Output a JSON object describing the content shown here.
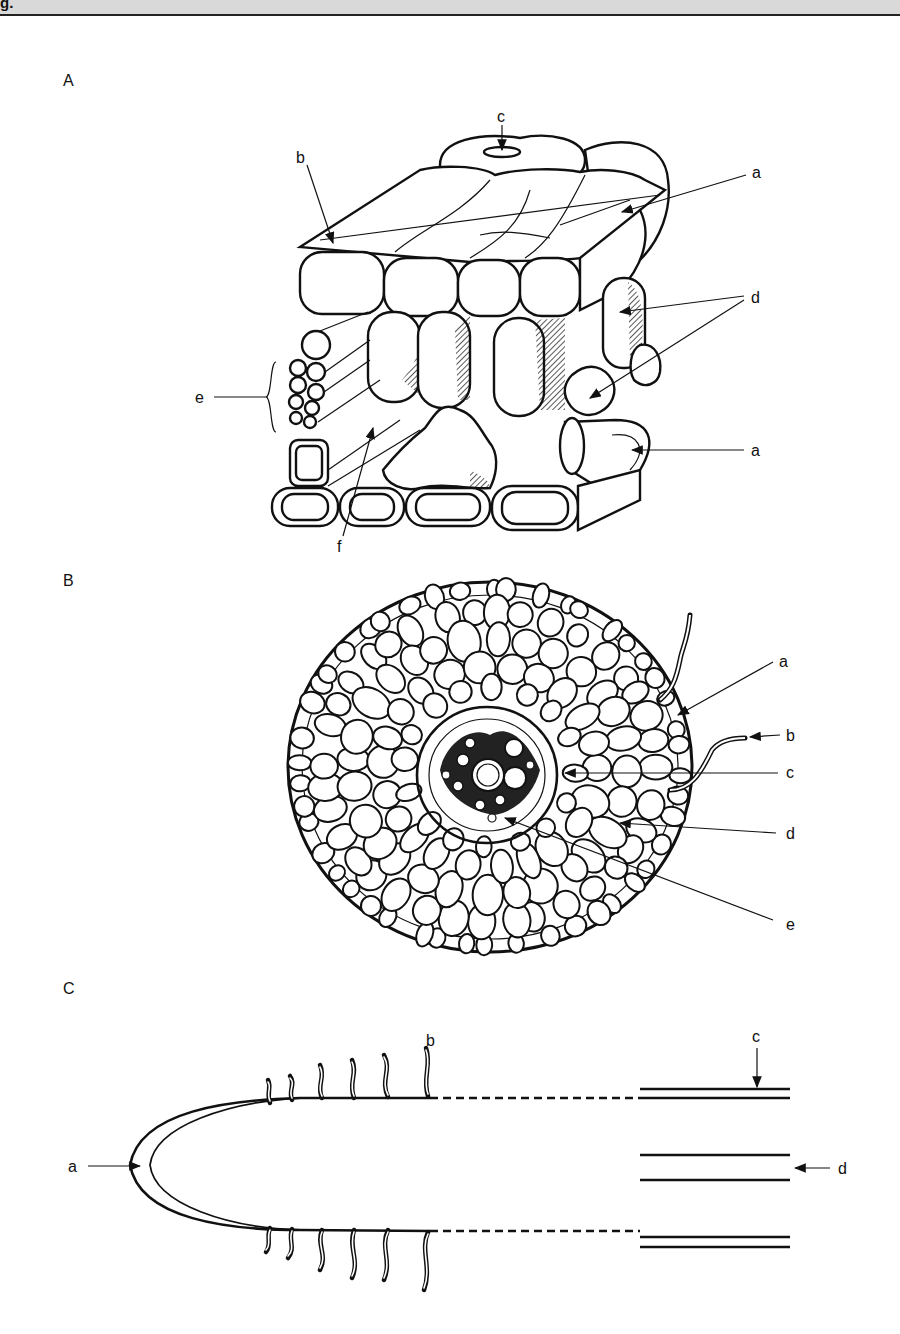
{
  "header": {
    "fragment_text": "g."
  },
  "panels": [
    {
      "id": "A",
      "letter": "A",
      "description": "3D block of root tissue: epidermis, cortex parenchyma, xylem vessels",
      "labels": {
        "a_top": "a",
        "b": "b",
        "c": "c",
        "d": "d",
        "e": "e",
        "f": "f",
        "a_bottom": "a"
      }
    },
    {
      "id": "B",
      "letter": "B",
      "description": "Root cross-section with root hairs and central stele",
      "labels": {
        "a": "a",
        "b": "b",
        "c": "c",
        "d": "d",
        "e": "e"
      }
    },
    {
      "id": "C",
      "letter": "C",
      "description": "Longitudinal root tip with root cap and root hairs",
      "labels": {
        "a": "a",
        "b": "b",
        "c": "c",
        "d": "d"
      }
    }
  ],
  "colors": {
    "ink": "#111111",
    "paper": "#ffffff",
    "header": "#d9d9d9"
  }
}
